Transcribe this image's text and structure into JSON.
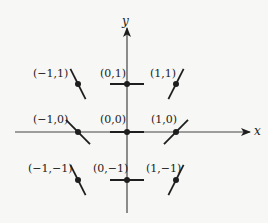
{
  "diagram": {
    "type": "slope-field",
    "axes": {
      "x_label": "x",
      "y_label": "y"
    },
    "colors": {
      "ink": "#1e1e1e",
      "axis": "#444444",
      "background": "#f7f7f5"
    },
    "points": [
      {
        "label": "(−1,1)",
        "x": -1,
        "y": 1,
        "slope": -2
      },
      {
        "label": "(0,1)",
        "x": 0,
        "y": 1,
        "slope": 0
      },
      {
        "label": "(1,1)",
        "x": 1,
        "y": 1,
        "slope": 2
      },
      {
        "label": "(−1,0)",
        "x": -1,
        "y": 0,
        "slope": -1
      },
      {
        "label": "(0,0)",
        "x": 0,
        "y": 0,
        "slope": 0
      },
      {
        "label": "(1,0)",
        "x": 1,
        "y": 0,
        "slope": 1
      },
      {
        "label": "(−1,−1)",
        "x": -1,
        "y": -1,
        "slope": -2
      },
      {
        "label": "(0,−1)",
        "x": 0,
        "y": -1,
        "slope": 0
      },
      {
        "label": "(1,−1)",
        "x": 1,
        "y": -1,
        "slope": 2
      }
    ]
  }
}
